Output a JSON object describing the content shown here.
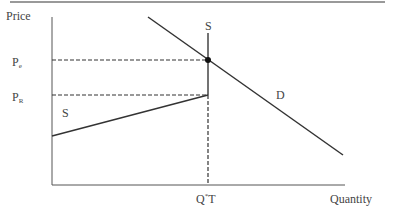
{
  "diagram": {
    "type": "supply-demand",
    "y_axis_label": "Price",
    "x_axis_label": "Quantity",
    "price_levels": [
      {
        "label_main": "P",
        "label_sub": "e"
      },
      {
        "label_main": "P",
        "label_sub": "R"
      }
    ],
    "quantity_label": {
      "main": "Q",
      "sup": "*",
      "rest": "T"
    },
    "curves": {
      "supply_lower_label": "S",
      "supply_vertical_label": "S",
      "demand_label": "D"
    },
    "colors": {
      "line": "#333333",
      "border": "#888888"
    }
  }
}
